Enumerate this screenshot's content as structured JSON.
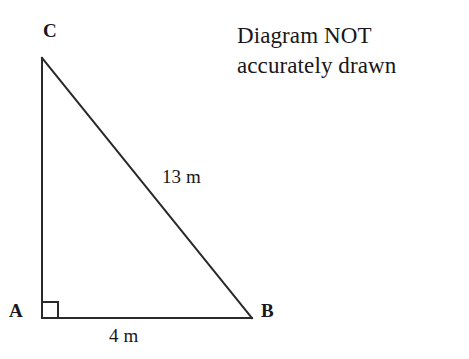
{
  "figure": {
    "kind": "right-triangle-diagram",
    "background_color": "#ffffff",
    "stroke_color": "#2a2a2a",
    "stroke_width": 2,
    "vertices": {
      "C": {
        "label": "C",
        "x": 42,
        "y": 58
      },
      "A": {
        "label": "A",
        "x": 42,
        "y": 318
      },
      "B": {
        "label": "B",
        "x": 252,
        "y": 318
      }
    },
    "right_angle": {
      "at_vertex": "A",
      "marker": "square",
      "size": 16
    },
    "sides": {
      "hypotenuse": {
        "from": "C",
        "to": "B",
        "measure": "13 m",
        "value": 13,
        "unit": "m"
      },
      "base": {
        "from": "A",
        "to": "B",
        "measure": "4 m",
        "value": 4,
        "unit": "m"
      },
      "vertical": {
        "from": "A",
        "to": "C",
        "measure": "",
        "value": null,
        "unit": "m"
      }
    }
  },
  "note": {
    "line1": "Diagram NOT",
    "line2": "accurately drawn"
  }
}
